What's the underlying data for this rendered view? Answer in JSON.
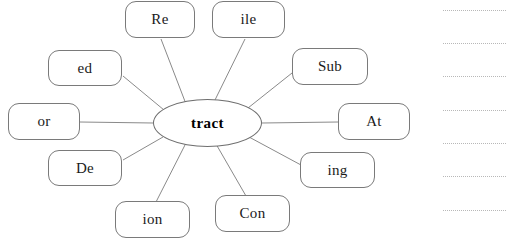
{
  "diagram": {
    "type": "word-web",
    "center": {
      "label": "tract",
      "x": 153,
      "y": 99,
      "width": 109,
      "height": 48
    },
    "nodes": [
      {
        "label": "Re",
        "x": 125,
        "y": 1,
        "width": 70,
        "height": 37,
        "anchor_x": 160,
        "anchor_y": 38
      },
      {
        "label": "ile",
        "x": 212,
        "y": 1,
        "width": 73,
        "height": 37,
        "anchor_x": 248,
        "anchor_y": 38
      },
      {
        "label": "ed",
        "x": 48,
        "y": 50,
        "width": 74,
        "height": 36,
        "anchor_x": 122,
        "anchor_y": 75
      },
      {
        "label": "Sub",
        "x": 292,
        "y": 48,
        "width": 76,
        "height": 37,
        "anchor_x": 292,
        "anchor_y": 72
      },
      {
        "label": "or",
        "x": 8,
        "y": 103,
        "width": 72,
        "height": 37,
        "anchor_x": 80,
        "anchor_y": 122
      },
      {
        "label": "At",
        "x": 338,
        "y": 103,
        "width": 72,
        "height": 37,
        "anchor_x": 338,
        "anchor_y": 122
      },
      {
        "label": "De",
        "x": 48,
        "y": 150,
        "width": 74,
        "height": 36,
        "anchor_x": 122,
        "anchor_y": 160
      },
      {
        "label": "ing",
        "x": 300,
        "y": 152,
        "width": 75,
        "height": 36,
        "anchor_x": 300,
        "anchor_y": 164
      },
      {
        "label": "ion",
        "x": 115,
        "y": 201,
        "width": 75,
        "height": 37,
        "anchor_x": 153,
        "anchor_y": 201
      },
      {
        "label": "Con",
        "x": 215,
        "y": 195,
        "width": 75,
        "height": 37,
        "anchor_x": 248,
        "anchor_y": 195
      }
    ],
    "spokes": [
      {
        "x1": 186,
        "y1": 104,
        "x2": 161,
        "y2": 39
      },
      {
        "x1": 214,
        "y1": 102,
        "x2": 245,
        "y2": 39
      },
      {
        "x1": 164,
        "y1": 110,
        "x2": 123,
        "y2": 76
      },
      {
        "x1": 248,
        "y1": 108,
        "x2": 292,
        "y2": 73
      },
      {
        "x1": 153,
        "y1": 123,
        "x2": 80,
        "y2": 122
      },
      {
        "x1": 262,
        "y1": 123,
        "x2": 338,
        "y2": 122
      },
      {
        "x1": 163,
        "y1": 137,
        "x2": 123,
        "y2": 160
      },
      {
        "x1": 249,
        "y1": 137,
        "x2": 301,
        "y2": 165
      },
      {
        "x1": 186,
        "y1": 143,
        "x2": 156,
        "y2": 202
      },
      {
        "x1": 216,
        "y1": 144,
        "x2": 246,
        "y2": 196
      }
    ]
  },
  "answer_lines": {
    "count": 7,
    "left": 443,
    "right": 506,
    "positions_y": [
      10,
      43,
      76,
      110,
      143,
      176,
      210
    ]
  },
  "colors": {
    "node_border": "#7a7a7a",
    "center_border": "#6e6e6e",
    "spoke": "#8a8a8a",
    "answer_line": "#b8b8b8",
    "text": "#1a1a1a",
    "background": "#ffffff"
  }
}
